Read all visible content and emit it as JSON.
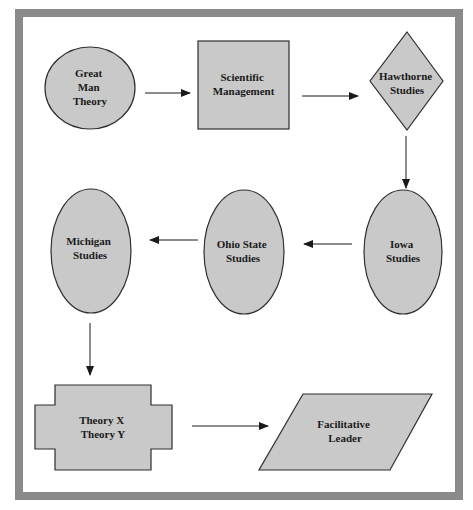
{
  "diagram": {
    "colors": {
      "frame": "#8a8a8a",
      "shape_fill": "#c9c9c9",
      "shape_stroke": "#2e2e2e",
      "arrow": "#1a1a1a",
      "background": "#ffffff"
    },
    "nodes": [
      {
        "id": "great-man-theory",
        "shape": "circle",
        "lines": [
          "Great",
          "Man",
          "Theory"
        ]
      },
      {
        "id": "scientific-management",
        "shape": "rectangle",
        "lines": [
          "Scientific",
          "Management"
        ]
      },
      {
        "id": "hawthorne-studies",
        "shape": "diamond",
        "lines": [
          "Hawthorne",
          "Studies"
        ]
      },
      {
        "id": "iowa-studies",
        "shape": "ellipse",
        "lines": [
          "Iowa",
          "Studies"
        ]
      },
      {
        "id": "ohio-state-studies",
        "shape": "ellipse",
        "lines": [
          "Ohio State",
          "Studies"
        ]
      },
      {
        "id": "michigan-studies",
        "shape": "ellipse",
        "lines": [
          "Michigan",
          "Studies"
        ]
      },
      {
        "id": "theory-x-theory-y",
        "shape": "cross",
        "lines": [
          "Theory X",
          "Theory Y"
        ]
      },
      {
        "id": "facilitative-leader",
        "shape": "parallelogram",
        "lines": [
          "Facilitative",
          "Leader"
        ]
      }
    ],
    "edges": [
      {
        "from": "great-man-theory",
        "to": "scientific-management",
        "direction": "right"
      },
      {
        "from": "scientific-management",
        "to": "hawthorne-studies",
        "direction": "right"
      },
      {
        "from": "hawthorne-studies",
        "to": "iowa-studies",
        "direction": "down"
      },
      {
        "from": "iowa-studies",
        "to": "ohio-state-studies",
        "direction": "left"
      },
      {
        "from": "ohio-state-studies",
        "to": "michigan-studies",
        "direction": "left"
      },
      {
        "from": "michigan-studies",
        "to": "theory-x-theory-y",
        "direction": "down"
      },
      {
        "from": "theory-x-theory-y",
        "to": "facilitative-leader",
        "direction": "right"
      }
    ]
  }
}
